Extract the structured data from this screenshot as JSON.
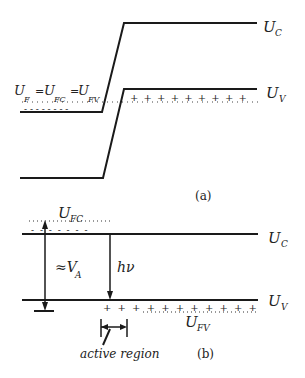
{
  "panel_a": {
    "caption": "(a)",
    "labels": {
      "uc": "U",
      "uc_sub": "C",
      "uv": "U",
      "uv_sub": "V",
      "eq_u1": "U",
      "eq_sub1": "F",
      "eq_eq1": "=",
      "eq_u2": "U",
      "eq_sub2": "FC",
      "eq_eq2": "=",
      "eq_u3": "U",
      "eq_sub3": "FV"
    },
    "plus_marks": "+ + + + + + + + +",
    "minus_marks": "- - - - - - - -"
  },
  "panel_b": {
    "caption": "(b)",
    "labels": {
      "ufc": "U",
      "ufc_sub": "FC",
      "uc": "U",
      "uc_sub": "C",
      "uv": "U",
      "uv_sub": "V",
      "ufv": "U",
      "ufv_sub": "FV",
      "va_approx": "≈V",
      "va_sub": "A",
      "hv": "hν",
      "active_region": "active region"
    },
    "plus_marks": "+ + + + + + + + + + +",
    "minus_marks": "- - - - - - -"
  },
  "colors": {
    "line": "#1a1a1a",
    "text": "#222222"
  }
}
